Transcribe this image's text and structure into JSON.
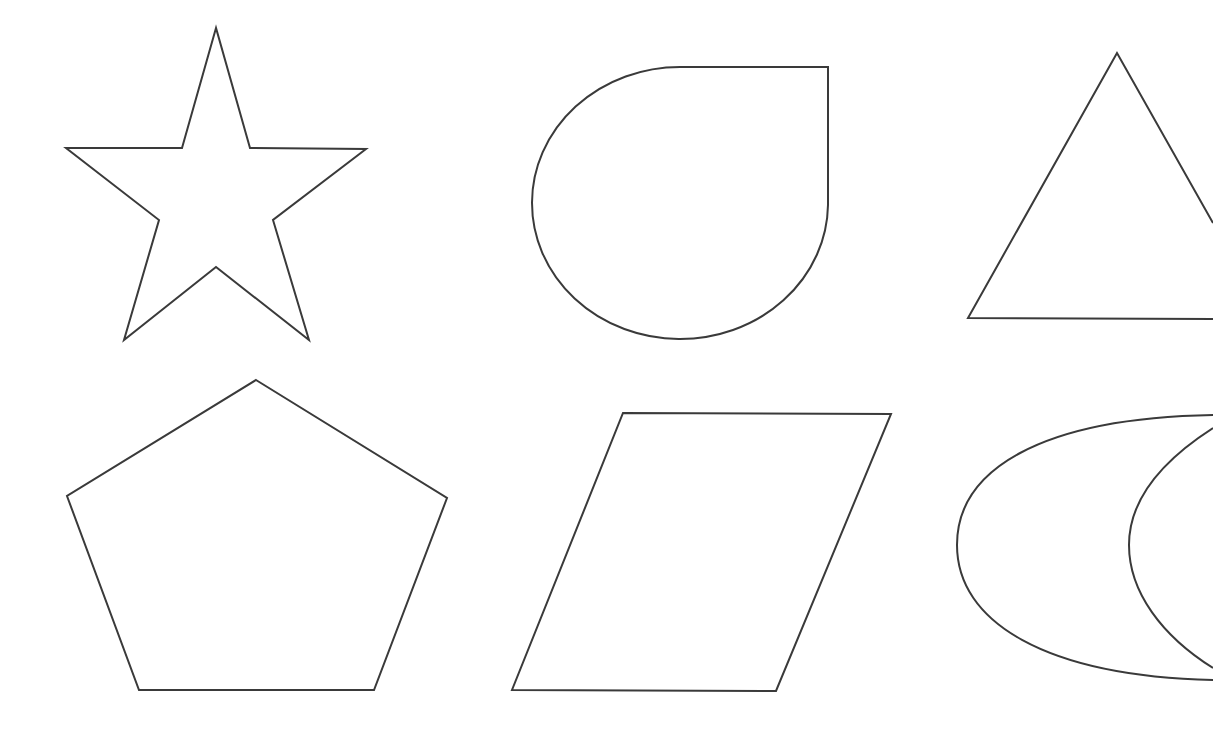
{
  "canvas": {
    "width": 1213,
    "height": 729,
    "background": "#ffffff",
    "stroke_color": "#3a3a3a",
    "stroke_width": 2
  },
  "shapes": [
    {
      "id": "star",
      "label": "star",
      "kind": "polygon",
      "points": "216,28 182,148 66,148 159,220 124,340 216,267 309,340 273,220 366,149 250,148"
    },
    {
      "id": "teardrop",
      "label": "teardrop",
      "kind": "path",
      "d": "M 828 67 L 828 205 A 148 136 0 1 1 680 67 L 828 67 Z"
    },
    {
      "id": "triangle",
      "label": "triangle",
      "kind": "polyline",
      "points": "1213,223 1117,53 968,318 1213,319"
    },
    {
      "id": "pentagon",
      "label": "pentagon",
      "kind": "polygon",
      "points": "256,380 447,498 374,690 139,690 67,496"
    },
    {
      "id": "parallelogram",
      "label": "parallelogram",
      "kind": "polygon",
      "points": "623,413 891,414 776,691 512,690"
    },
    {
      "id": "crescent-outer",
      "label": "crescent outer arc",
      "kind": "path",
      "d": "M 1213 415 C 1040 418 957 470 957 545 C 957 622 1045 676 1213 680"
    },
    {
      "id": "crescent-inner",
      "label": "crescent inner arc",
      "kind": "path",
      "d": "M 1213 428 C 1160 462 1129 500 1129 545 C 1129 592 1162 636 1213 668"
    }
  ]
}
